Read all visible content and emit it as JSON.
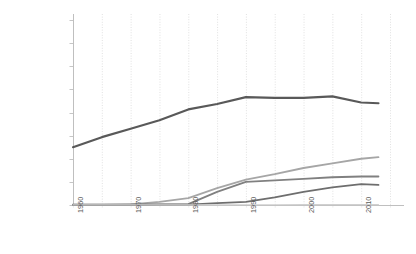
{
  "chart_data": {
    "type": "line",
    "title": "",
    "subtitle": "",
    "xlabel": "",
    "ylabel": "",
    "grid": {
      "vertical": true,
      "horizontal": false,
      "vertical_interval_years": 5,
      "color": "#d9d9d9"
    },
    "legend": {
      "visible": false,
      "position": "none"
    },
    "axis": {
      "x_line_color": "#bfbfbf",
      "y_line_color": "#bfbfbf",
      "tick_color": "#bfbfbf"
    },
    "xlim": [
      1960,
      2015
    ],
    "ylim": [
      0,
      240000000
    ],
    "ytick_values": [
      0,
      30000000,
      60000000,
      90000000,
      120000000,
      150000000,
      180000000,
      210000000,
      240000000
    ],
    "yticks": [
      "0",
      "30,000,000",
      "60,000,000",
      "90,000,000",
      "120,000,000",
      "150,000,000",
      "180,000,000",
      "210,000,000",
      "240,000,000"
    ],
    "xtick_values": [
      1960,
      1970,
      1980,
      1990,
      2000,
      2010
    ],
    "xticks": [
      "1960",
      "1970",
      "1980",
      "1990",
      "2000",
      "2010"
    ],
    "x": [
      1960,
      1965,
      1970,
      1975,
      1980,
      1985,
      1990,
      1995,
      2000,
      2005,
      2010,
      2013
    ],
    "series": [
      {
        "name": "series-1",
        "color": "#595959",
        "width": 2.2,
        "values": [
          75000000,
          88000000,
          99000000,
          110000000,
          124000000,
          131000000,
          140000000,
          139000000,
          139000000,
          141000000,
          133000000,
          132000000
        ]
      },
      {
        "name": "series-2",
        "color": "#a6a6a6",
        "width": 1.8,
        "values": [
          400000,
          500000,
          700000,
          4000000,
          9000000,
          22000000,
          33000000,
          40000000,
          48000000,
          54000000,
          60000000,
          62000000
        ]
      },
      {
        "name": "series-3",
        "color": "#808080",
        "width": 1.8,
        "values": [
          300000,
          400000,
          600000,
          900000,
          1200000,
          17000000,
          30000000,
          32000000,
          34000000,
          36000000,
          37000000,
          37000000
        ]
      },
      {
        "name": "series-4",
        "color": "#6e6e6e",
        "width": 1.8,
        "values": [
          200000,
          250000,
          300000,
          400000,
          600000,
          2500000,
          4000000,
          10000000,
          17000000,
          23000000,
          27000000,
          26000000
        ]
      },
      {
        "name": "series-5",
        "color": "#d0d0d0",
        "width": 1.2,
        "values": [
          100000,
          120000,
          150000,
          180000,
          220000,
          260000,
          300000,
          340000,
          380000,
          420000,
          460000,
          480000
        ]
      }
    ]
  }
}
